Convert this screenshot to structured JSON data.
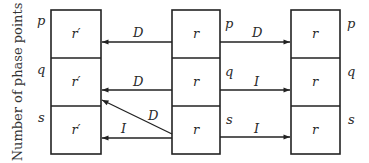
{
  "diagram": {
    "y_axis_label": "Number of phase points",
    "row_labels": [
      "p",
      "q",
      "s"
    ],
    "columns": [
      {
        "cells": [
          "r′",
          "r′",
          "r′"
        ]
      },
      {
        "cells": [
          "r",
          "r",
          "r"
        ]
      },
      {
        "cells": [
          "r",
          "r",
          "r"
        ]
      }
    ],
    "left_arrows": [
      {
        "label": "D",
        "from_row": "p",
        "to_row": "p"
      },
      {
        "label": "D",
        "from_row": "q",
        "to_row": "q"
      },
      {
        "label": "D",
        "from_row": "s",
        "to_row": "q-s boundary"
      },
      {
        "label": "I",
        "from_row": "s",
        "to_row": "s"
      }
    ],
    "right_arrows": [
      {
        "label": "D",
        "row": "p"
      },
      {
        "label": "I",
        "row": "q"
      },
      {
        "label": "I",
        "row": "s"
      }
    ]
  }
}
